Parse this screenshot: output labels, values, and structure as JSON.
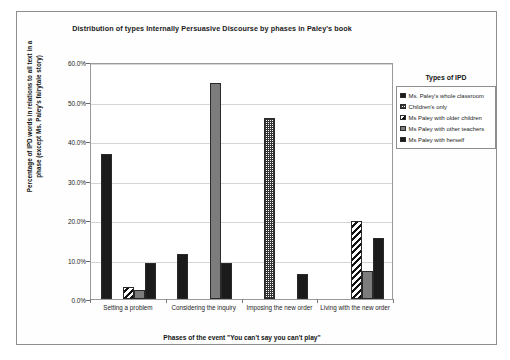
{
  "chart_data": {
    "type": "bar",
    "title": "Distribution of types Internally Persuasive Discourse by phases in Paley's book",
    "xlabel": "Phases of the event \"You can't say you can't play\"",
    "ylabel": "Percentage of IPD words in relations to all text in a phase (except Ms. Paley's fairytale story)",
    "categories": [
      "Setting a problem",
      "Considering the inquiry",
      "Imposing the new order",
      "Living with the new order"
    ],
    "series": [
      {
        "name": "Ms. Paley's whole classroom",
        "pattern": "solid-black",
        "values": [
          36.7,
          11.3,
          0.0,
          0.0
        ]
      },
      {
        "name": "Children's only",
        "pattern": "checker",
        "values": [
          0.0,
          0.0,
          45.9,
          0.0
        ]
      },
      {
        "name": "Ms Paley with older children",
        "pattern": "diagonal-stripe",
        "values": [
          3.0,
          0.0,
          0.0,
          19.8
        ]
      },
      {
        "name": "Ms Paley with other teachers",
        "pattern": "gray",
        "values": [
          2.2,
          54.8,
          0.0,
          7.0
        ]
      },
      {
        "name": "Ms Paley with herself",
        "pattern": "solid-black",
        "values": [
          9.0,
          9.0,
          6.3,
          15.5
        ]
      }
    ],
    "ylim": [
      0,
      60
    ],
    "yticks": [
      "0.0%",
      "10.0%",
      "20.0%",
      "30.0%",
      "40.0%",
      "50.0%",
      "60.0%"
    ],
    "ytick_values": [
      0,
      10,
      20,
      30,
      40,
      50,
      60
    ],
    "grid": true,
    "legend_position": "right",
    "legend_title": "Types of IPD",
    "colors": {
      "black": "#1b1b1b",
      "gray": "#7c7c7c",
      "white": "#ffffff",
      "gridline": "#d4d4d4",
      "frame": "#8e8e8e"
    }
  }
}
